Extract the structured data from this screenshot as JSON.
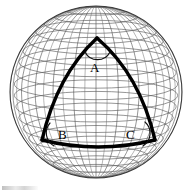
{
  "figure": {
    "background_color": "#ffffff",
    "width": 193,
    "height": 195
  },
  "sphere": {
    "name": "wireframe-globe",
    "center_x": 96,
    "center_y": 92,
    "radius": 86,
    "outline_color": "#3a3a3a",
    "grid_color": "#555555",
    "meridian_count": 24,
    "parallel_count": 18,
    "pole_visible": "north",
    "top_clipped": true
  },
  "triangle": {
    "name": "spherical-triangle-ABC",
    "stroke_color": "#000000",
    "stroke_width": 3.4,
    "vertices": [
      {
        "label": "A",
        "x": 97,
        "y": 38,
        "label_x": 90,
        "label_y": 61
      },
      {
        "label": "B",
        "x": 42,
        "y": 140,
        "label_x": 58,
        "label_y": 128
      },
      {
        "label": "C",
        "x": 155,
        "y": 140,
        "label_x": 126,
        "label_y": 128
      }
    ],
    "edges": [
      {
        "name": "edge-AB",
        "from": "A",
        "to": "B",
        "bulge": "outward-left"
      },
      {
        "name": "edge-AC",
        "from": "A",
        "to": "C",
        "bulge": "outward-right"
      },
      {
        "name": "edge-BC",
        "from": "B",
        "to": "C",
        "bulge": "outward-down"
      }
    ],
    "angle_arcs": [
      {
        "name": "angle-arc-A",
        "at_vertex": "A"
      },
      {
        "name": "angle-arc-B",
        "at_vertex": "B"
      },
      {
        "name": "angle-arc-C",
        "at_vertex": "C"
      }
    ]
  },
  "labels": {
    "vertex_a": "A",
    "vertex_b": "B",
    "vertex_c": "C"
  },
  "artifacts": {
    "bottom_left_smudge": ""
  }
}
